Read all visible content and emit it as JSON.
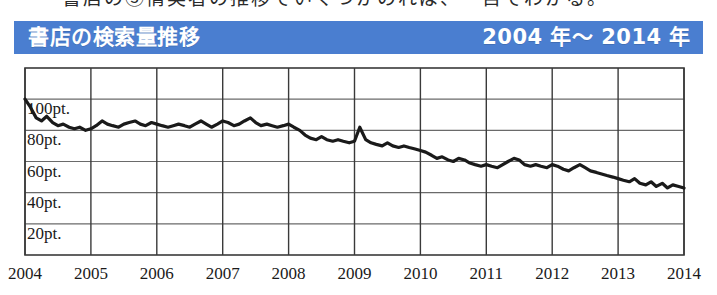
{
  "page": {
    "clipped_text_above": "書店の③情実者の推移でいくつかのれば、一目でわかる。"
  },
  "header": {
    "title": "書店の検索量推移",
    "period": "2004 年〜 2014 年",
    "bar_color": "#4a7ed0",
    "text_color": "#ffffff"
  },
  "chart_data": {
    "type": "line",
    "title": "書店の検索量推移",
    "subtitle": "2004 年〜 2014 年",
    "xlabel": "",
    "ylabel": "",
    "xlim": [
      2004,
      2014
    ],
    "ylim": [
      0,
      120
    ],
    "grid": true,
    "legend": false,
    "line_color": "#1a1a1a",
    "x_tick_labels": [
      "2004",
      "2005",
      "2006",
      "2007",
      "2008",
      "2009",
      "2010",
      "2011",
      "2012",
      "2013",
      "2014"
    ],
    "x_ticks": [
      2004,
      2005,
      2006,
      2007,
      2008,
      2009,
      2010,
      2011,
      2012,
      2013,
      2014
    ],
    "y_tick_labels": [
      "100pt.",
      "80pt.",
      "60pt.",
      "40pt.",
      "20pt."
    ],
    "y_ticks": [
      100,
      80,
      60,
      40,
      20
    ],
    "series": [
      {
        "name": "書店 検索量",
        "unit": "pt.",
        "x": [
          2004.0,
          2004.08,
          2004.17,
          2004.25,
          2004.33,
          2004.42,
          2004.5,
          2004.58,
          2004.67,
          2004.75,
          2004.83,
          2004.92,
          2005.0,
          2005.08,
          2005.17,
          2005.25,
          2005.33,
          2005.42,
          2005.5,
          2005.58,
          2005.67,
          2005.75,
          2005.83,
          2005.92,
          2006.0,
          2006.08,
          2006.17,
          2006.25,
          2006.33,
          2006.42,
          2006.5,
          2006.58,
          2006.67,
          2006.75,
          2006.83,
          2006.92,
          2007.0,
          2007.08,
          2007.17,
          2007.25,
          2007.33,
          2007.42,
          2007.5,
          2007.58,
          2007.67,
          2007.75,
          2007.83,
          2007.92,
          2008.0,
          2008.08,
          2008.17,
          2008.25,
          2008.33,
          2008.42,
          2008.5,
          2008.58,
          2008.67,
          2008.75,
          2008.83,
          2008.92,
          2009.0,
          2009.08,
          2009.17,
          2009.25,
          2009.33,
          2009.42,
          2009.5,
          2009.58,
          2009.67,
          2009.75,
          2009.83,
          2009.92,
          2010.0,
          2010.08,
          2010.17,
          2010.25,
          2010.33,
          2010.42,
          2010.5,
          2010.58,
          2010.67,
          2010.75,
          2010.83,
          2010.92,
          2011.0,
          2011.08,
          2011.17,
          2011.25,
          2011.33,
          2011.42,
          2011.5,
          2011.58,
          2011.67,
          2011.75,
          2011.83,
          2011.92,
          2012.0,
          2012.08,
          2012.17,
          2012.25,
          2012.33,
          2012.42,
          2012.5,
          2012.58,
          2012.67,
          2012.75,
          2012.83,
          2012.92,
          2013.0,
          2013.08,
          2013.17,
          2013.25,
          2013.33,
          2013.42,
          2013.5,
          2013.58,
          2013.67,
          2013.75,
          2013.83,
          2013.92,
          2014.0
        ],
        "values": [
          100,
          95,
          88,
          86,
          89,
          85,
          83,
          84,
          82,
          81,
          82,
          80,
          81,
          83,
          86,
          84,
          83,
          82,
          84,
          85,
          86,
          84,
          83,
          85,
          84,
          83,
          82,
          83,
          84,
          83,
          82,
          84,
          86,
          84,
          82,
          84,
          86,
          85,
          83,
          84,
          86,
          88,
          85,
          83,
          84,
          83,
          82,
          83,
          84,
          82,
          80,
          77,
          75,
          74,
          76,
          74,
          73,
          74,
          73,
          72,
          73,
          82,
          74,
          72,
          71,
          70,
          72,
          70,
          69,
          70,
          69,
          68,
          67,
          66,
          64,
          62,
          63,
          61,
          60,
          62,
          61,
          59,
          58,
          57,
          58,
          57,
          56,
          58,
          60,
          62,
          61,
          58,
          57,
          58,
          57,
          56,
          58,
          57,
          55,
          54,
          56,
          58,
          56,
          54,
          53,
          52,
          51,
          50,
          49,
          48,
          47,
          49,
          46,
          45,
          47,
          44,
          46,
          43,
          45,
          44,
          43
        ]
      }
    ],
    "annotations": [
      {
        "label": "start_value",
        "x": 2004.0,
        "y": 100,
        "text": "100pt."
      },
      {
        "label": "end_value",
        "x": 2014.0,
        "y": 43,
        "text": "約40pt."
      }
    ]
  },
  "geometry": {
    "plot_left": 25,
    "plot_right": 684,
    "plot_top": 68,
    "plot_bottom": 255
  }
}
